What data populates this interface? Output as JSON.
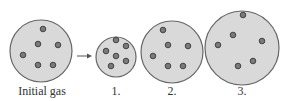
{
  "diagram": {
    "colors": {
      "gas_fill": "#d9d9d9",
      "outline": "#666666",
      "particle_fill": "#7a7a7a",
      "particle_outline": "#444444"
    },
    "containers": [
      {
        "id": "initial",
        "label": "Initial gas",
        "cx": 41,
        "cy": 51,
        "r": 31,
        "particles": [
          [
            43,
            29
          ],
          [
            38,
            44
          ],
          [
            58,
            45
          ],
          [
            23,
            55
          ],
          [
            38,
            65
          ],
          [
            53,
            65
          ]
        ]
      },
      {
        "id": "option-1",
        "label": "1.",
        "cx": 116,
        "cy": 57,
        "r": 20,
        "particles": [
          [
            116,
            40
          ],
          [
            126,
            46
          ],
          [
            106,
            51
          ],
          [
            116,
            56
          ],
          [
            126,
            61
          ],
          [
            111,
            66
          ]
        ]
      },
      {
        "id": "option-2",
        "label": "2.",
        "cx": 172,
        "cy": 52,
        "r": 31,
        "particles": [
          [
            163,
            30
          ],
          [
            168,
            45
          ],
          [
            188,
            46
          ],
          [
            153,
            56
          ],
          [
            168,
            66
          ],
          [
            183,
            66
          ]
        ]
      },
      {
        "id": "option-3",
        "label": "3.",
        "cx": 242,
        "cy": 48,
        "r": 37,
        "particles": [
          [
            243,
            15
          ],
          [
            233,
            35
          ],
          [
            262,
            41
          ],
          [
            218,
            45
          ],
          [
            238,
            66
          ],
          [
            253,
            61
          ]
        ]
      }
    ],
    "arrow": {
      "x1": 77,
      "y1": 56,
      "x2": 92,
      "y2": 56
    }
  }
}
